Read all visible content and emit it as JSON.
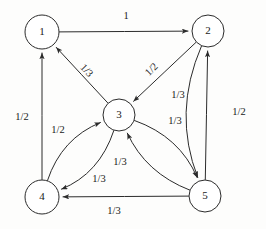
{
  "figure": {
    "type": "directed-graph",
    "title": "",
    "background_color": "#fdfdfc",
    "stroke_color": "#2b2b2b",
    "width": 266,
    "height": 229
  },
  "chart_data": {
    "type": "diagram",
    "subtype": "directed-weighted-graph",
    "title": "",
    "xlabel": "",
    "ylabel": "",
    "nodes": [
      {
        "id": "1",
        "label": "1",
        "x": 42,
        "y": 32,
        "r": 17
      },
      {
        "id": "2",
        "label": "2",
        "x": 208,
        "y": 31,
        "r": 16
      },
      {
        "id": "3",
        "label": "3",
        "x": 119,
        "y": 115,
        "r": 16
      },
      {
        "id": "4",
        "label": "4",
        "x": 42,
        "y": 197,
        "r": 17
      },
      {
        "id": "5",
        "label": "5",
        "x": 205,
        "y": 196,
        "r": 16
      }
    ],
    "edges": [
      {
        "from": "1",
        "to": "2",
        "label": "1",
        "label_x": 126,
        "label_y": 17,
        "label_rotate": 0,
        "curve": 0
      },
      {
        "from": "3",
        "to": "1",
        "label": "1/3",
        "label_x": 86,
        "label_y": 71,
        "label_rotate": 47,
        "curve": 0
      },
      {
        "from": "2",
        "to": "3",
        "label": "1/2",
        "label_x": 152,
        "label_y": 70,
        "label_rotate": -45,
        "curve": 0
      },
      {
        "from": "4",
        "to": "1",
        "label": "1/2",
        "label_x": 22,
        "label_y": 118,
        "label_rotate": 0,
        "curve": 0
      },
      {
        "from": "5",
        "to": "2",
        "label": "1/3",
        "label_x": 178,
        "label_y": 96,
        "label_rotate": 0,
        "curve": 0
      },
      {
        "from": "2",
        "to": "5",
        "label": "1/2",
        "label_x": 239,
        "label_y": 113,
        "label_rotate": 0,
        "curve": 34
      },
      {
        "from": "4",
        "to": "3",
        "label": "1/2",
        "label_x": 58,
        "label_y": 131,
        "label_rotate": 0,
        "curve": -26
      },
      {
        "from": "3",
        "to": "4",
        "label": "1/3",
        "label_x": 99,
        "label_y": 180,
        "label_rotate": 0,
        "curve": -26
      },
      {
        "from": "5",
        "to": "3",
        "label": "1/3",
        "label_x": 120,
        "label_y": 163,
        "label_rotate": 0,
        "curve": -24
      },
      {
        "from": "3",
        "to": "5",
        "label": "1/3",
        "label_x": 175,
        "label_y": 122,
        "label_rotate": 0,
        "curve": -26
      },
      {
        "from": "5",
        "to": "4",
        "label": "1/3",
        "label_x": 114,
        "label_y": 212,
        "label_rotate": 0,
        "curve": 0
      }
    ]
  }
}
